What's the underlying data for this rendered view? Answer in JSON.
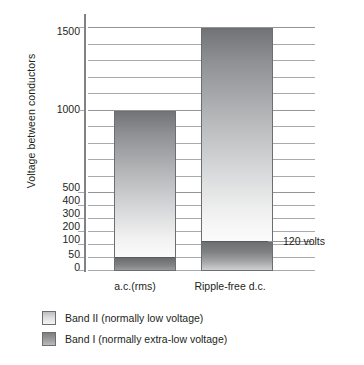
{
  "chart_data": {
    "type": "bar",
    "title": "",
    "subtitle": "",
    "xlabel": "",
    "ylabel": "Voltage between conductors",
    "categories": [
      "a.c.(rms)",
      "Ripple-free d.c."
    ],
    "stacked": true,
    "series": [
      {
        "name": "Band I (normally extra-low voltage)",
        "values": [
          50,
          120
        ]
      },
      {
        "name": "Band II (normally low voltage)",
        "values": [
          1000,
          1500
        ]
      }
    ],
    "bar_totals": [
      1000,
      1500
    ],
    "ylim": [
      0,
      1500
    ],
    "yticks": [
      0,
      50,
      100,
      200,
      300,
      400,
      500,
      1000,
      1500
    ],
    "ytick_labels": [
      "0",
      "50",
      "100",
      "200",
      "300",
      "400",
      "500",
      "1000",
      "1500"
    ],
    "gridlines": [
      50,
      100,
      200,
      300,
      400,
      500,
      600,
      700,
      800,
      900,
      1000,
      1100,
      1200,
      1300,
      1400,
      1500
    ],
    "grid": true,
    "axis_note": "Non-linear two-segment vertical scale: 0-500 expanded below, 500-1500 in 100 V steps above",
    "annotations": [
      {
        "text": "120 volts",
        "value": 120,
        "attached_to": "Ripple-free d.c."
      }
    ],
    "legend": {
      "position": "below-plot",
      "entries": [
        {
          "label": "Band II (normally low voltage)",
          "swatch": "light-gradient"
        },
        {
          "label": "Band I (normally extra-low voltage)",
          "swatch": "dark-gradient"
        }
      ]
    },
    "colors": {
      "band2_top": "#6f7173",
      "band2_bottom": "#fbfbfb",
      "band1_top": "#6d6f71",
      "band1_bottom": "#cfd0d1",
      "gridline": "#a7a9ac",
      "axis": "#808285",
      "text": "#231f20",
      "background": "#ffffff"
    }
  },
  "axis": {
    "y_title": "Voltage between conductors",
    "ticks": [
      {
        "label": "1500",
        "top": 26
      },
      {
        "label": "1000",
        "top": 104
      },
      {
        "label": "500",
        "top": 182
      },
      {
        "label": "400",
        "top": 195
      },
      {
        "label": "300",
        "top": 208
      },
      {
        "label": "200",
        "top": 221
      },
      {
        "label": "100",
        "top": 234
      },
      {
        "label": "50",
        "top": 249
      },
      {
        "label": "0",
        "top": 262
      }
    ]
  },
  "categories": [
    {
      "label": "a.c.(rms)",
      "left": 96,
      "width": 78
    },
    {
      "label": "Ripple-free d.c.",
      "left": 182,
      "width": 96
    }
  ],
  "annotation": {
    "text": "120 volts"
  },
  "legend": {
    "items": [
      {
        "label": "Band II (normally low voltage)"
      },
      {
        "label": "Band I (normally extra-low voltage)"
      }
    ]
  }
}
